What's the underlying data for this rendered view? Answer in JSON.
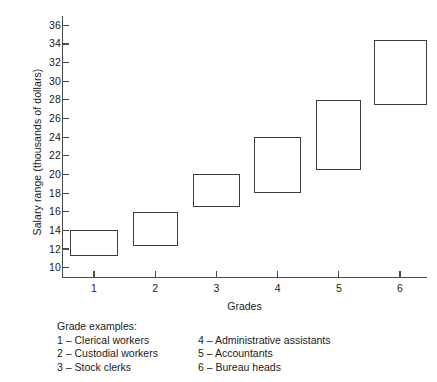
{
  "chart_data": {
    "type": "bar",
    "title": "",
    "xlabel": "Grades",
    "ylabel": "Salary range (thousands of dollars)",
    "categories": [
      "1",
      "2",
      "3",
      "4",
      "5",
      "6"
    ],
    "ylim": [
      9,
      37
    ],
    "yticks": [
      10,
      12,
      14,
      16,
      18,
      20,
      22,
      24,
      26,
      28,
      30,
      32,
      34,
      36
    ],
    "grid": false,
    "legend_position": "below-plot",
    "series": [
      {
        "name": "Salary range",
        "ranges": [
          {
            "category": "1",
            "low": 11.2,
            "high": 14.0
          },
          {
            "category": "2",
            "low": 12.3,
            "high": 16.0
          },
          {
            "category": "3",
            "low": 16.5,
            "high": 20.0
          },
          {
            "category": "4",
            "low": 18.0,
            "high": 24.0
          },
          {
            "category": "5",
            "low": 20.5,
            "high": 28.0
          },
          {
            "category": "6",
            "low": 27.4,
            "high": 34.4
          }
        ]
      }
    ],
    "annotations": {
      "legend_title": "Grade examples:",
      "entries": [
        "1 – Clerical workers",
        "2 – Custodial workers",
        "3 – Stock clerks",
        "4 – Administrative assistants",
        "5 – Accountants",
        "6 – Bureau heads"
      ]
    }
  },
  "colors": {
    "box_stroke": "#3c3c3c",
    "axis": "#4a4a4a",
    "background": "#ffffff",
    "text": "#1a1a1a"
  }
}
